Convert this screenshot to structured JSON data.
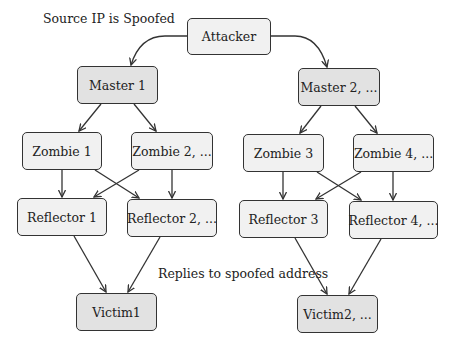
{
  "annotations": {
    "source_spoofed": "Source IP is Spoofed",
    "replies": "Replies to spoofed address"
  },
  "nodes": {
    "attacker": "Attacker",
    "master1": "Master 1",
    "master2": "Master 2, ...",
    "zombie1": "Zombie 1",
    "zombie2": "Zombie 2, ...",
    "zombie3": "Zombie 3",
    "zombie4": "Zombie 4, ...",
    "reflector1": "Reflector 1",
    "reflector2": "Reflector 2, ...",
    "reflector3": "Reflector 3",
    "reflector4": "Reflector 4, ...",
    "victim1": "Victim1",
    "victim2": "Victim2, ..."
  },
  "edges": [
    [
      "attacker",
      "master1"
    ],
    [
      "attacker",
      "master2"
    ],
    [
      "master1",
      "zombie1"
    ],
    [
      "master1",
      "zombie2"
    ],
    [
      "master2",
      "zombie3"
    ],
    [
      "master2",
      "zombie4"
    ],
    [
      "zombie1",
      "reflector1"
    ],
    [
      "zombie1",
      "reflector2"
    ],
    [
      "zombie2",
      "reflector1"
    ],
    [
      "zombie2",
      "reflector2"
    ],
    [
      "zombie3",
      "reflector3"
    ],
    [
      "zombie3",
      "reflector4"
    ],
    [
      "zombie4",
      "reflector3"
    ],
    [
      "zombie4",
      "reflector4"
    ],
    [
      "reflector1",
      "victim1"
    ],
    [
      "reflector2",
      "victim1"
    ],
    [
      "reflector3",
      "victim2"
    ],
    [
      "reflector4",
      "victim2"
    ]
  ]
}
